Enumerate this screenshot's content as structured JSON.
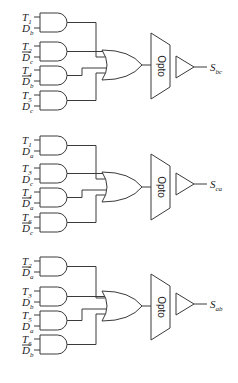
{
  "diagram": {
    "type": "logic-circuit",
    "blocks": [
      {
        "output": {
          "letter": "S",
          "sub": "bc"
        },
        "block_label": "Opto",
        "and_gates": [
          {
            "inputs": [
              {
                "letter": "T",
                "sub": "1",
                "bar": false
              },
              {
                "letter": "D",
                "sub": "b",
                "bar": false
              }
            ]
          },
          {
            "inputs": [
              {
                "letter": "T",
                "sub": "2",
                "bar": false
              },
              {
                "letter": "D",
                "sub": "c",
                "bar": true
              }
            ]
          },
          {
            "inputs": [
              {
                "letter": "T",
                "sub": "4",
                "bar": false
              },
              {
                "letter": "D",
                "sub": "b",
                "bar": true
              }
            ]
          },
          {
            "inputs": [
              {
                "letter": "T",
                "sub": "5",
                "bar": false
              },
              {
                "letter": "D",
                "sub": "c",
                "bar": false
              }
            ]
          }
        ]
      },
      {
        "output": {
          "letter": "S",
          "sub": "ca"
        },
        "block_label": "Opto",
        "and_gates": [
          {
            "inputs": [
              {
                "letter": "T",
                "sub": "1",
                "bar": false
              },
              {
                "letter": "D",
                "sub": "a",
                "bar": false
              }
            ]
          },
          {
            "inputs": [
              {
                "letter": "T",
                "sub": "3",
                "bar": false
              },
              {
                "letter": "D",
                "sub": "c",
                "bar": false
              }
            ]
          },
          {
            "inputs": [
              {
                "letter": "T",
                "sub": "4",
                "bar": false
              },
              {
                "letter": "D",
                "sub": "a",
                "bar": true
              }
            ]
          },
          {
            "inputs": [
              {
                "letter": "T",
                "sub": "6",
                "bar": false
              },
              {
                "letter": "D",
                "sub": "c",
                "bar": true
              }
            ]
          }
        ]
      },
      {
        "output": {
          "letter": "S",
          "sub": "ab"
        },
        "block_label": "Opto",
        "and_gates": [
          {
            "inputs": [
              {
                "letter": "T",
                "sub": "2",
                "bar": false
              },
              {
                "letter": "D",
                "sub": "a",
                "bar": true
              }
            ]
          },
          {
            "inputs": [
              {
                "letter": "T",
                "sub": "3",
                "bar": false
              },
              {
                "letter": "D",
                "sub": "b",
                "bar": false
              }
            ]
          },
          {
            "inputs": [
              {
                "letter": "T",
                "sub": "5",
                "bar": false
              },
              {
                "letter": "D",
                "sub": "a",
                "bar": false
              }
            ]
          },
          {
            "inputs": [
              {
                "letter": "T",
                "sub": "6",
                "bar": false
              },
              {
                "letter": "D",
                "sub": "b",
                "bar": true
              }
            ]
          }
        ]
      }
    ]
  }
}
